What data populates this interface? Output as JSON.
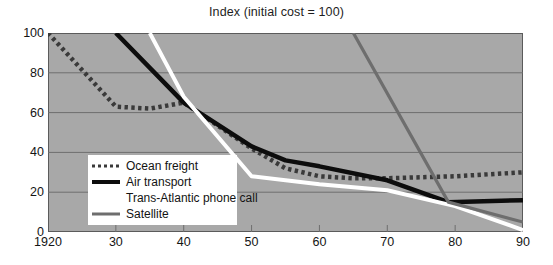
{
  "chart_data": {
    "type": "line",
    "title": "Index (initial cost = 100)",
    "xlabel": "",
    "ylabel": "",
    "xlim": [
      1920,
      1990
    ],
    "ylim": [
      0,
      100
    ],
    "grid": true,
    "legend_position": "inside-lower-left",
    "x_ticks": [
      "1920",
      "30",
      "40",
      "50",
      "60",
      "70",
      "80",
      "90"
    ],
    "x_tick_values": [
      1920,
      1930,
      1940,
      1950,
      1960,
      1970,
      1980,
      1990
    ],
    "y_ticks": [
      "0",
      "20",
      "40",
      "60",
      "80",
      "100"
    ],
    "y_tick_values": [
      0,
      20,
      40,
      60,
      80,
      100
    ],
    "series": [
      {
        "name": "Ocean freight",
        "style": "dotted",
        "color": "#3a3a3a",
        "x": [
          1920,
          1930,
          1935,
          1940,
          1950,
          1955,
          1960,
          1965,
          1970,
          1980,
          1990
        ],
        "values": [
          100,
          63,
          62,
          65,
          42,
          32,
          28,
          27,
          27,
          28,
          30
        ]
      },
      {
        "name": "Air transport",
        "style": "solid",
        "color": "#0d0d0d",
        "x": [
          1930,
          1940,
          1950,
          1955,
          1960,
          1970,
          1979,
          1990
        ],
        "values": [
          100,
          65,
          43,
          36,
          33,
          26,
          15,
          16
        ]
      },
      {
        "name": "Trans-Atlantic phone call",
        "style": "solid",
        "color": "#ffffff",
        "x": [
          1935,
          1940,
          1950,
          1955,
          1960,
          1970,
          1980,
          1990
        ],
        "values": [
          100,
          68,
          28,
          26,
          24,
          21,
          13,
          1
        ]
      },
      {
        "name": "Satellite",
        "style": "solid",
        "color": "#6e6e6e",
        "x": [
          1965,
          1979,
          1990
        ],
        "values": [
          100,
          15,
          5
        ]
      }
    ]
  },
  "chart": {
    "title": "Index (initial cost = 100)"
  },
  "legend": {
    "items": [
      {
        "label": "Ocean freight",
        "swatch": "dotted-dark-line-icon"
      },
      {
        "label": "Air transport",
        "swatch": "solid-black-line-icon"
      },
      {
        "label": "Trans-Atlantic phone call",
        "swatch": "solid-white-line-icon"
      },
      {
        "label": "Satellite",
        "swatch": "solid-gray-line-icon"
      }
    ]
  },
  "colors": {
    "plot_background": "#a8a8a8",
    "page_background": "#ffffff",
    "axis": "#5b5b5b",
    "gridline": "#6e6e6e",
    "ocean_freight": "#3a3a3a",
    "air_transport": "#0d0d0d",
    "phone_call": "#ffffff",
    "satellite": "#6e6e6e",
    "text": "#141414"
  }
}
